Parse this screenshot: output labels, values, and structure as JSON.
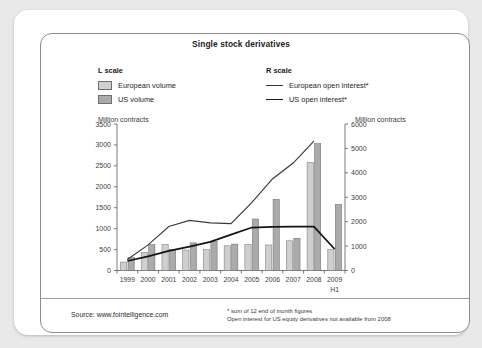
{
  "card": {
    "title": "Single stock derivatives"
  },
  "legend": {
    "left": {
      "heading": "L scale",
      "items": [
        {
          "label": "European volume",
          "swatch": "bar-swatch-light",
          "color": "#cfcfcf"
        },
        {
          "label": "US volume",
          "swatch": "bar-swatch-dark",
          "color": "#aaaaaa"
        }
      ]
    },
    "right": {
      "heading": "R scale",
      "items": [
        {
          "label": "European open interest*",
          "swatch": "line-swatch-thin",
          "color": "#3a3a3a"
        },
        {
          "label": "US open interest*",
          "swatch": "line-swatch-thick",
          "color": "#141414"
        }
      ]
    }
  },
  "axis_captions": {
    "left": "Million contracts",
    "right": "Million contracts"
  },
  "footer": {
    "source": "Source: www.fointelligence.com",
    "footnotes": [
      "* sum of 12 end of month figures",
      "Open interest for US equity derivatives not available from 2008"
    ]
  },
  "chart_data": {
    "type": "bar",
    "title": "Single stock derivatives",
    "xlabel": "",
    "ylabel": "Million contracts",
    "y2label": "Million contracts",
    "grid": false,
    "legend_position": "top",
    "categories": [
      "1999",
      "2000",
      "2001",
      "2002",
      "2003",
      "2004",
      "2005",
      "2006",
      "2007",
      "2008",
      "2009"
    ],
    "x_note": "H1",
    "x_note_category": "2009",
    "yticks": [
      0,
      500,
      1000,
      1500,
      2000,
      2500,
      3000,
      3500
    ],
    "ylim": [
      0,
      3500
    ],
    "y2ticks": [
      0,
      1000,
      2000,
      3000,
      4000,
      5000,
      6000
    ],
    "y2lim": [
      0,
      6000
    ],
    "series": [
      {
        "name": "European volume",
        "axis": "left",
        "kind": "bar",
        "color": "#cfcfcf",
        "values": [
          200,
          430,
          620,
          490,
          500,
          590,
          620,
          610,
          710,
          2580,
          500
        ]
      },
      {
        "name": "US volume",
        "axis": "left",
        "kind": "bar",
        "color": "#aaaaaa",
        "values": [
          310,
          620,
          500,
          660,
          700,
          630,
          1230,
          1700,
          770,
          3030,
          1580
        ]
      },
      {
        "name": "European open interest*",
        "axis": "right",
        "kind": "line",
        "color": "#3a3a3a",
        "values": [
          450,
          1050,
          1800,
          2050,
          1950,
          1920,
          2780,
          3750,
          4400,
          5300,
          null
        ]
      },
      {
        "name": "US open interest*",
        "axis": "right",
        "kind": "line",
        "color": "#141414",
        "values": [
          390,
          580,
          800,
          980,
          1170,
          1470,
          1760,
          1790,
          1800,
          1800,
          880
        ]
      }
    ]
  }
}
